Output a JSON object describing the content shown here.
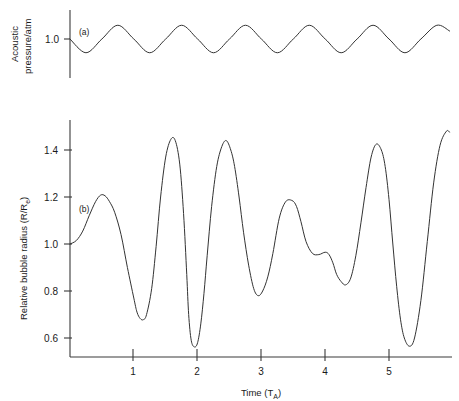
{
  "figure": {
    "background_color": "#ffffff",
    "curve_color": "#333333",
    "axis_color": "#3a3a3a"
  },
  "panel_a": {
    "tag": "(a)",
    "ylabel_line1": "Acoustic",
    "ylabel_line2": "pressure/atm",
    "ytick_labels": [
      "1.0"
    ]
  },
  "panel_b": {
    "tag": "(b)",
    "ylabel": "Relative bubble radius (R/R",
    "ylabel_sub": "e",
    "ylabel_end": ")",
    "ytick_labels": [
      "1.4",
      "1.2",
      "1.0",
      "0.8",
      "0.6"
    ]
  },
  "xaxis": {
    "label_main": "Time (T",
    "label_sub": "A",
    "label_end": ")",
    "tick_labels": [
      "1",
      "2",
      "3",
      "4",
      "5"
    ]
  },
  "chart_data": {
    "type": "line",
    "title": "",
    "xlabel": "Time (T_A)",
    "grid": false,
    "legend": false,
    "panels": [
      {
        "id": "a",
        "tag": "(a)",
        "ylabel": "Acoustic pressure/atm",
        "yticks": [
          1.0
        ],
        "ylim": [
          0.93,
          1.06
        ],
        "xlim": [
          0,
          5.95
        ],
        "description": "Sinusoidal driving acoustic pressure, unit period, amplitude 0.045 atm about 1.0 atm, negative-going first",
        "series": [
          {
            "name": "Acoustic pressure",
            "formula": "P = 1.0 - 0.045*sin(2*pi*t)",
            "amplitude": 0.045,
            "mean": 1.0,
            "period": 1.0,
            "x": [
              0.0,
              0.25,
              0.5,
              0.75,
              1.0,
              1.25,
              1.5,
              1.75,
              2.0,
              2.25,
              2.5,
              2.75,
              3.0,
              3.25,
              3.5,
              3.75,
              4.0,
              4.25,
              4.5,
              4.75,
              5.0,
              5.25,
              5.5,
              5.75,
              5.95
            ],
            "y": [
              1.0,
              0.955,
              1.0,
              1.045,
              1.0,
              0.955,
              1.0,
              1.045,
              1.0,
              0.955,
              1.0,
              1.045,
              1.0,
              0.955,
              1.0,
              1.045,
              1.0,
              0.955,
              1.0,
              1.045,
              1.0,
              0.955,
              1.0,
              1.045,
              1.026
            ]
          }
        ]
      },
      {
        "id": "b",
        "tag": "(b)",
        "ylabel": "Relative bubble radius (R/R_e)",
        "yticks": [
          0.6,
          0.8,
          1.0,
          1.2,
          1.4
        ],
        "ylim": [
          0.54,
          1.52
        ],
        "xlim": [
          0,
          5.95
        ],
        "description": "Nonlinear bubble radius response showing period-doubled large amplitude oscillations with a shoulder near t=3.5",
        "series": [
          {
            "name": "Relative bubble radius R/Re",
            "x": [
              0.0,
              0.1,
              0.2,
              0.3,
              0.4,
              0.48,
              0.55,
              0.62,
              0.7,
              0.8,
              0.9,
              1.0,
              1.05,
              1.1,
              1.15,
              1.2,
              1.28,
              1.35,
              1.42,
              1.5,
              1.58,
              1.65,
              1.72,
              1.78,
              1.83,
              1.86,
              1.9,
              1.95,
              2.0,
              2.05,
              2.1,
              2.15,
              2.22,
              2.3,
              2.38,
              2.45,
              2.52,
              2.58,
              2.65,
              2.72,
              2.8,
              2.88,
              2.95,
              3.02,
              3.1,
              3.18,
              3.28,
              3.38,
              3.48,
              3.55,
              3.62,
              3.7,
              3.8,
              3.9,
              4.0,
              4.06,
              4.12,
              4.18,
              4.25,
              4.32,
              4.4,
              4.48,
              4.56,
              4.64,
              4.72,
              4.8,
              4.88,
              4.94,
              5.0,
              5.06,
              5.12,
              5.18,
              5.24,
              5.32,
              5.4,
              5.5,
              5.6,
              5.7,
              5.8,
              5.9,
              5.95
            ],
            "y": [
              1.0,
              1.015,
              1.055,
              1.12,
              1.18,
              1.208,
              1.205,
              1.18,
              1.135,
              1.04,
              0.9,
              0.77,
              0.71,
              0.683,
              0.678,
              0.7,
              0.81,
              0.99,
              1.2,
              1.37,
              1.445,
              1.44,
              1.34,
              1.13,
              0.87,
              0.7,
              0.59,
              0.562,
              0.58,
              0.66,
              0.79,
              0.95,
              1.16,
              1.33,
              1.415,
              1.44,
              1.4,
              1.33,
              1.2,
              1.05,
              0.91,
              0.81,
              0.78,
              0.8,
              0.86,
              0.96,
              1.11,
              1.18,
              1.185,
              1.16,
              1.095,
              1.01,
              0.96,
              0.955,
              0.965,
              0.955,
              0.92,
              0.87,
              0.84,
              0.826,
              0.855,
              0.95,
              1.09,
              1.24,
              1.37,
              1.425,
              1.4,
              1.33,
              1.19,
              1.0,
              0.82,
              0.68,
              0.6,
              0.565,
              0.6,
              0.76,
              1.01,
              1.26,
              1.42,
              1.48,
              1.475
            ]
          }
        ]
      }
    ]
  }
}
